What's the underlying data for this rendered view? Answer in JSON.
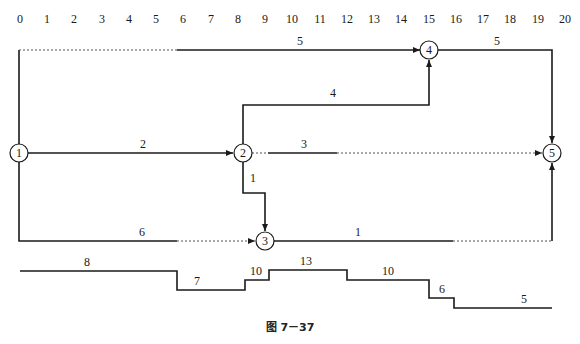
{
  "timeline": {
    "ticks": [
      "0",
      "1",
      "2",
      "3",
      "4",
      "5",
      "6",
      "7",
      "8",
      "9",
      "10",
      "11",
      "12",
      "13",
      "14",
      "15",
      "16",
      "17",
      "18",
      "19",
      "20"
    ]
  },
  "nodes": [
    {
      "id": "1",
      "label": "1"
    },
    {
      "id": "2",
      "label": "2"
    },
    {
      "id": "3",
      "label": "3"
    },
    {
      "id": "4",
      "label": "4"
    },
    {
      "id": "5",
      "label": "5"
    }
  ],
  "activities": [
    {
      "from": "1",
      "to": "4",
      "duration": "5",
      "label": "5"
    },
    {
      "from": "1",
      "to": "2",
      "duration": "2",
      "label": "2"
    },
    {
      "from": "1",
      "to": "3",
      "duration": "6",
      "label": "6"
    },
    {
      "from": "2",
      "to": "4",
      "duration": "4",
      "label": "4"
    },
    {
      "from": "2",
      "to": "5",
      "duration": "3",
      "label": "3"
    },
    {
      "from": "2",
      "to": "3",
      "duration": "1",
      "label": "1"
    },
    {
      "from": "3",
      "to": "5",
      "duration": "1",
      "label": "1"
    },
    {
      "from": "4",
      "to": "5",
      "duration": "5",
      "label": "5"
    }
  ],
  "resource_profile": {
    "segments": [
      {
        "value": "8",
        "label": "8"
      },
      {
        "value": "7",
        "label": "7"
      },
      {
        "value": "10",
        "label": "10"
      },
      {
        "value": "13",
        "label": "13"
      },
      {
        "value": "10",
        "label": "10"
      },
      {
        "value": "6",
        "label": "6"
      },
      {
        "value": "5",
        "label": "5"
      }
    ]
  },
  "caption": "图 7－37"
}
